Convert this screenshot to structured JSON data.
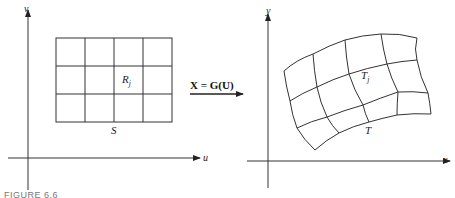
{
  "left_panel": {
    "vertical_axis_label": "v",
    "horizontal_axis_label": "u",
    "region_label": "S",
    "cell_label_main": "R",
    "cell_label_sub": "j",
    "grid": {
      "columns": 4,
      "rows": 3
    }
  },
  "mapping": {
    "label": "X = G(U)"
  },
  "right_panel": {
    "vertical_axis_label": "y",
    "horizontal_axis_label": "x",
    "region_label": "T",
    "cell_label_main": "T",
    "cell_label_sub": "j",
    "grid": {
      "columns": 4,
      "rows": 3
    }
  },
  "caption": "FIGURE 6.6"
}
